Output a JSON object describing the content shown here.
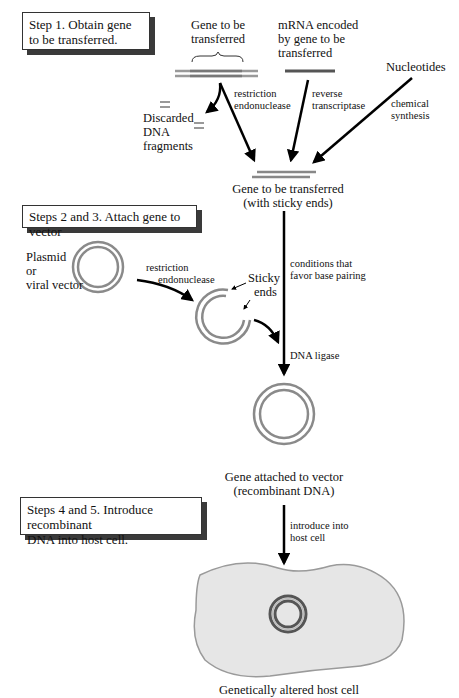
{
  "steps": {
    "step1": "Step 1. Obtain gene to be transferred.",
    "step2_3": "Steps 2 and 3. Attach gene to vector",
    "step4_5_line1": "Steps 4 and 5. Introduce recombinant",
    "step4_5_line2": "DNA into host cell."
  },
  "sources": {
    "gene_line1": "Gene to be",
    "gene_line2": "transferred",
    "mrna_line1": "mRNA encoded",
    "mrna_line2": "by gene to be",
    "mrna_line3": "transferred",
    "nucleotides": "Nucleotides"
  },
  "processes": {
    "restriction_line1": "restriction",
    "restriction_line2": "endonuclease",
    "reverse_line1": "reverse",
    "reverse_line2": "transcriptase",
    "chemical_line1": "chemical",
    "chemical_line2": "synthesis",
    "discarded_line1": "Discarded",
    "discarded_line2": "DNA",
    "discarded_line3": "fragments"
  },
  "sticky_gene": {
    "line1": "Gene to be transferred",
    "line2": "(with sticky ends)"
  },
  "vector": {
    "plasmid_line1": "Plasmid",
    "plasmid_line2": "or",
    "plasmid_line3": "viral vector",
    "restriction_line1": "restriction",
    "restriction_line2": "endonuclease",
    "sticky_line1": "Sticky",
    "sticky_line2": "ends",
    "conditions_line1": "conditions that",
    "conditions_line2": "favor base pairing",
    "ligase": "DNA ligase"
  },
  "recombinant": {
    "line1": "Gene attached to vector",
    "line2": "(recombinant DNA)"
  },
  "host": {
    "introduce_line1": "introduce into",
    "introduce_line2": "host cell",
    "caption": "Genetically altered host cell"
  },
  "colors": {
    "dna_strand": "#8a8a8a",
    "dna_dark": "#555555",
    "cell_fill": "#e6e6e6",
    "cell_border": "#9a9a9a",
    "arrow": "#000000"
  }
}
